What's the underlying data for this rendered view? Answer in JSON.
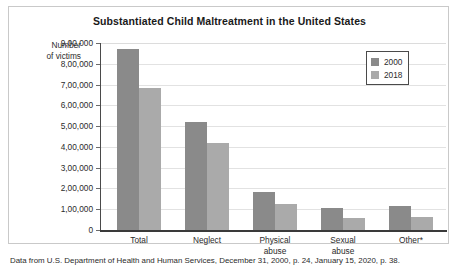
{
  "figure": {
    "title": "Substantiated Child Maltreatment in the United States",
    "source_note": "Data from U.S. Department of Health and Human Services, December 31, 2000, p. 24, January 15, 2020, p. 38."
  },
  "axis": {
    "y_title_line1": "Number",
    "y_title_line2": "of victims",
    "tick_labels": [
      "9,00,000",
      "8,00,000",
      "7,00,000",
      "6,00,000",
      "5,00,000",
      "4,00,000",
      "3,00,000",
      "2,00,000",
      "1,00,000",
      "0"
    ]
  },
  "legend": {
    "items": [
      {
        "label": "2000",
        "color": "#8a8a8a"
      },
      {
        "label": "2018",
        "color": "#aaaaaa"
      }
    ]
  },
  "chart_data": {
    "type": "bar",
    "title": "Substantiated Child Maltreatment in the United States",
    "xlabel": "",
    "ylabel": "Number of victims",
    "ylim": [
      0,
      900000
    ],
    "ytick_values": [
      900000,
      800000,
      700000,
      600000,
      500000,
      400000,
      300000,
      200000,
      100000,
      0
    ],
    "ytick_labels": [
      "9,00,000",
      "8,00,000",
      "7,00,000",
      "6,00,000",
      "5,00,000",
      "4,00,000",
      "3,00,000",
      "2,00,000",
      "1,00,000",
      "0"
    ],
    "grid": true,
    "legend_position": "top-right",
    "categories": [
      "Total",
      "Neglect",
      "Physical abuse",
      "Sexual abuse",
      "Other*"
    ],
    "category_labels": [
      {
        "line1": "Total",
        "line2": ""
      },
      {
        "line1": "Neglect",
        "line2": ""
      },
      {
        "line1": "Physical",
        "line2": "abuse"
      },
      {
        "line1": "Sexual",
        "line2": "abuse"
      },
      {
        "line1": "Other*",
        "line2": ""
      }
    ],
    "series": [
      {
        "name": "2000",
        "color": "#8a8a8a",
        "values": [
          870000,
          520000,
          185000,
          105000,
          115000
        ]
      },
      {
        "name": "2018",
        "color": "#aaaaaa",
        "values": [
          685000,
          420000,
          125000,
          60000,
          65000
        ]
      }
    ]
  }
}
